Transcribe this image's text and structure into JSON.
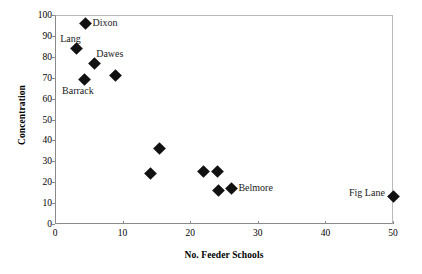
{
  "chart_data": {
    "type": "scatter",
    "title": "",
    "xlabel": "No. Feeder Schools",
    "ylabel": "Concentration",
    "xlim": [
      0,
      50
    ],
    "ylim": [
      0,
      100
    ],
    "xticks": [
      0,
      10,
      20,
      30,
      40,
      50
    ],
    "yticks": [
      0,
      10,
      20,
      30,
      40,
      50,
      60,
      70,
      80,
      90,
      100
    ],
    "grid": false,
    "legend": "none",
    "marker": "filled-diamond",
    "marker_color": "#111111",
    "points": [
      {
        "label": "Lang",
        "x": 3.2,
        "y": 84,
        "label_pos": "above-left"
      },
      {
        "label": "Dixon",
        "x": 4.5,
        "y": 96,
        "label_pos": "right"
      },
      {
        "label": "Barrack",
        "x": 4.3,
        "y": 69,
        "label_pos": "below-left"
      },
      {
        "label": "Dawes",
        "x": 5.8,
        "y": 77,
        "label_pos": "above-right"
      },
      {
        "label": "",
        "x": 8.9,
        "y": 71,
        "label_pos": "none"
      },
      {
        "label": "",
        "x": 15.4,
        "y": 36,
        "label_pos": "none"
      },
      {
        "label": "",
        "x": 14.2,
        "y": 24,
        "label_pos": "none"
      },
      {
        "label": "",
        "x": 22.0,
        "y": 25,
        "label_pos": "none"
      },
      {
        "label": "",
        "x": 24.1,
        "y": 25,
        "label_pos": "none"
      },
      {
        "label": "",
        "x": 24.2,
        "y": 16,
        "label_pos": "none"
      },
      {
        "label": "Belmore",
        "x": 26.1,
        "y": 17,
        "label_pos": "right"
      },
      {
        "label": "Fig Lane",
        "x": 50.0,
        "y": 13,
        "label_pos": "left"
      }
    ]
  },
  "axes": {
    "x_title": "No. Feeder Schools",
    "y_title": "Concentration",
    "x_tick_labels": [
      "0",
      "10",
      "20",
      "30",
      "40",
      "50"
    ],
    "y_tick_labels": [
      "0",
      "10",
      "20",
      "30",
      "40",
      "50",
      "60",
      "70",
      "80",
      "90",
      "100"
    ]
  },
  "labels": {
    "lang": "Lang",
    "dixon": "Dixon",
    "barrack": "Barrack",
    "dawes": "Dawes",
    "belmore": "Belmore",
    "fig_lane": "Fig Lane"
  },
  "colors": {
    "marker": "#111111",
    "axis": "#8a8a8a",
    "text": "#000000"
  }
}
